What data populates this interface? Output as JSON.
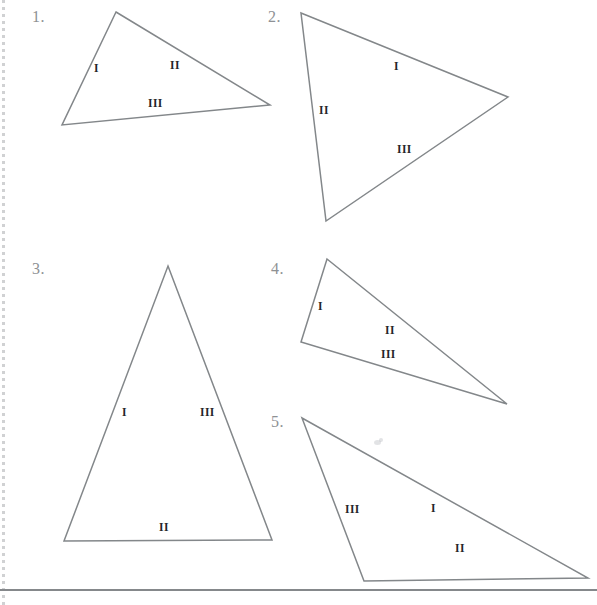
{
  "page": {
    "background_color": "#ffffff",
    "width": 597,
    "height": 605,
    "stroke_color": "#83878a",
    "number_color": "#8e9194",
    "label_color": "#24262a"
  },
  "bottom_rule": {
    "name": "bottom-rule",
    "y": 589,
    "color": "#85888b"
  },
  "left_edge": {
    "name": "page-edge-artifact",
    "color": "#aaacaf"
  },
  "problems": [
    {
      "number": "1.",
      "number_pos": {
        "x": 32,
        "y": 8
      },
      "points": "116,12 270,105 62,125",
      "labels": [
        {
          "text": "I",
          "x": 94,
          "y": 62
        },
        {
          "text": "II",
          "x": 170,
          "y": 59
        },
        {
          "text": "III",
          "x": 148,
          "y": 97
        }
      ]
    },
    {
      "number": "2.",
      "number_pos": {
        "x": 268,
        "y": 8
      },
      "points": "301,13 508,97 326,221",
      "labels": [
        {
          "text": "I",
          "x": 394,
          "y": 60
        },
        {
          "text": "II",
          "x": 319,
          "y": 104
        },
        {
          "text": "III",
          "x": 397,
          "y": 143
        }
      ]
    },
    {
      "number": "3.",
      "number_pos": {
        "x": 32,
        "y": 260
      },
      "points": "168,266 272,540 64,541",
      "labels": [
        {
          "text": "I",
          "x": 122,
          "y": 406
        },
        {
          "text": "III",
          "x": 200,
          "y": 406
        },
        {
          "text": "II",
          "x": 159,
          "y": 521
        }
      ]
    },
    {
      "number": "4.",
      "number_pos": {
        "x": 271,
        "y": 260
      },
      "points": "327,259 507,404 301,342",
      "labels": [
        {
          "text": "I",
          "x": 318,
          "y": 300
        },
        {
          "text": "II",
          "x": 385,
          "y": 324
        },
        {
          "text": "III",
          "x": 381,
          "y": 348
        }
      ]
    },
    {
      "number": "5.",
      "number_pos": {
        "x": 271,
        "y": 413
      },
      "points": "302,418 588,578 364,581",
      "labels": [
        {
          "text": "III",
          "x": 345,
          "y": 503
        },
        {
          "text": "I",
          "x": 431,
          "y": 502
        },
        {
          "text": "II",
          "x": 455,
          "y": 542
        }
      ]
    }
  ],
  "smudges": [
    {
      "x": 374,
      "y": 440,
      "w": 7,
      "h": 5
    },
    {
      "x": 379,
      "y": 438,
      "w": 4,
      "h": 4
    }
  ]
}
